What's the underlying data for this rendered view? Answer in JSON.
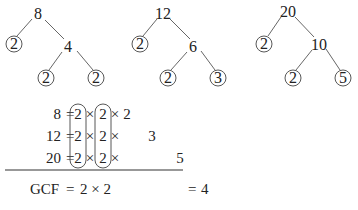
{
  "trees": [
    {
      "root": "8",
      "left_leaf": "2",
      "mid": "4",
      "leaf_a": "2",
      "leaf_b": "2"
    },
    {
      "root": "12",
      "left_leaf": "2",
      "mid": "6",
      "leaf_a": "2",
      "leaf_b": "3"
    },
    {
      "root": "20",
      "left_leaf": "2",
      "mid": "10",
      "leaf_a": "2",
      "leaf_b": "5"
    }
  ],
  "factorization": {
    "rows": [
      {
        "number": "8",
        "eq": "=",
        "f1": "2",
        "x1": "×",
        "f2": "2",
        "x2": "×",
        "f3": "2",
        "f4": "",
        "f5": ""
      },
      {
        "number": "12",
        "eq": "=",
        "f1": "2",
        "x1": "×",
        "f2": "2",
        "x2": "×",
        "f3": "",
        "f4": "3",
        "f5": ""
      },
      {
        "number": "20",
        "eq": "=",
        "f1": "2",
        "x1": "×",
        "f2": "2",
        "x2": "×",
        "f3": "",
        "f4": "",
        "f5": "5"
      }
    ],
    "result": {
      "label": "GCF",
      "eq": "=",
      "expr": "2 × 2",
      "final_eq": "=",
      "value": "4"
    }
  }
}
